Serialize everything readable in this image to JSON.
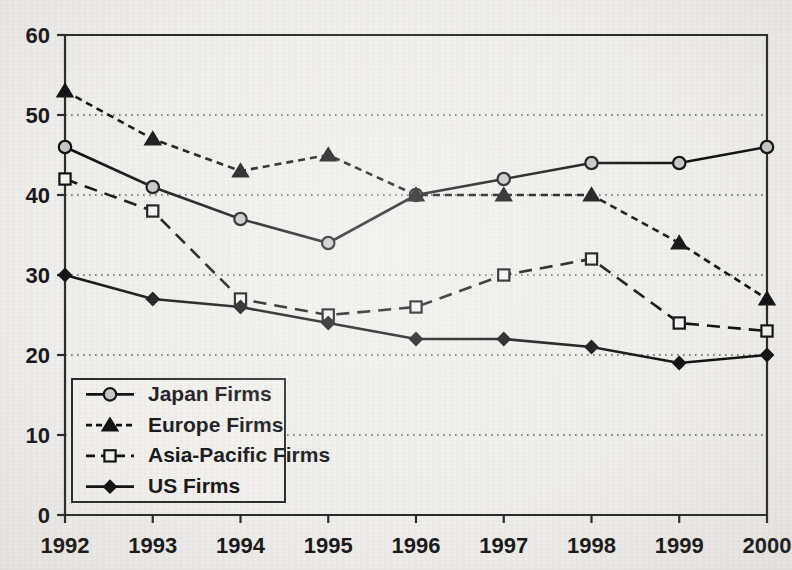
{
  "chart_data": {
    "type": "line",
    "title": "",
    "xlabel": "",
    "ylabel": "",
    "categories": [
      "1992",
      "1993",
      "1994",
      "1995",
      "1996",
      "1997",
      "1998",
      "1999",
      "2000"
    ],
    "x": [
      1992,
      1993,
      1994,
      1995,
      1996,
      1997,
      1998,
      1999,
      2000
    ],
    "ylim": [
      0,
      60
    ],
    "xlim": [
      1992,
      2000
    ],
    "yticks": [
      0,
      10,
      20,
      30,
      40,
      50,
      60
    ],
    "ytick_labels": [
      "0",
      "10",
      "20",
      "30",
      "40",
      "50",
      "60"
    ],
    "xtick_labels": [
      "1992",
      "1993",
      "1994",
      "1995",
      "1996",
      "1997",
      "1998",
      "1999",
      "2000"
    ],
    "grid": true,
    "grid_axis": "y",
    "legend_position": "lower-left",
    "series": [
      {
        "name": "Japan Firms",
        "values": [
          46,
          41,
          37,
          34,
          40,
          42,
          44,
          44,
          46
        ],
        "marker": "circle",
        "marker_style": "light-filled-circle",
        "line_style": "solid",
        "color": "#101112"
      },
      {
        "name": "Europe Firms",
        "values": [
          53,
          47,
          43,
          45,
          40,
          40,
          40,
          34,
          27
        ],
        "marker": "triangle",
        "marker_style": "filled-triangle",
        "line_style": "dotted",
        "color": "#101112"
      },
      {
        "name": "Asia-Pacific Firms",
        "values": [
          42,
          38,
          27,
          25,
          26,
          30,
          32,
          24,
          23
        ],
        "marker": "square",
        "marker_style": "open-square",
        "line_style": "dashed",
        "color": "#101112"
      },
      {
        "name": "US Firms",
        "values": [
          30,
          27,
          26,
          24,
          22,
          22,
          21,
          19,
          20
        ],
        "marker": "diamond",
        "marker_style": "filled-diamond",
        "line_style": "solid",
        "color": "#101112"
      }
    ]
  },
  "legend": {
    "entries": [
      {
        "label": "Japan Firms"
      },
      {
        "label": "Europe Firms"
      },
      {
        "label": "Asia-Pacific Firms"
      },
      {
        "label": "US Firms"
      }
    ]
  },
  "colors": {
    "background": "#f2f0ed",
    "ink": "#101112",
    "axis": "#2a2b2d",
    "grid": "#56585a",
    "circle_fill": "#c9c9c7"
  }
}
